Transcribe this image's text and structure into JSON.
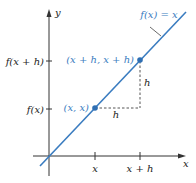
{
  "diagram": {
    "type": "coordinate-graph",
    "colors": {
      "axis": "#333333",
      "line": "#3a7cc0",
      "point": "#2f6fb3",
      "dashed": "#555555",
      "blue_label": "#3a7cc0",
      "black_label": "#222222"
    },
    "axes": {
      "x_label": "x",
      "y_label": "y"
    },
    "function_label": "f(x) = x",
    "x_ticks": [
      {
        "label": "x"
      },
      {
        "label": "x + h"
      }
    ],
    "y_ticks": [
      {
        "label": "f(x)"
      },
      {
        "label": "f(x + h)"
      }
    ],
    "points": [
      {
        "label": "(x, x)"
      },
      {
        "label": "(x + h, x + h)"
      }
    ],
    "increments": {
      "horizontal_label": "h",
      "vertical_label": "h"
    }
  }
}
